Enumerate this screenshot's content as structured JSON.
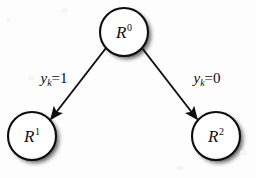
{
  "figure": {
    "type": "tree-diagram",
    "background_color": "#fdfdfd",
    "line_color": "#0d0d0d",
    "shadow_color": "#9a9a9a"
  },
  "nodes": [
    {
      "id": "root",
      "name": "node-r0",
      "label_base": "R",
      "label_sup": "0",
      "cx": 124,
      "cy": 32,
      "r": 24
    },
    {
      "id": "left",
      "name": "node-r1",
      "label_base": "R",
      "label_sup": "1",
      "cx": 32,
      "cy": 136,
      "r": 24
    },
    {
      "id": "right",
      "name": "node-r2",
      "label_base": "R",
      "label_sup": "2",
      "cx": 216,
      "cy": 136,
      "r": 24
    }
  ],
  "edges": [
    {
      "id": "edge-left",
      "name": "edge-root-to-r1",
      "from": "root",
      "to": "left",
      "label_var": "y",
      "label_sub": "k",
      "label_eq": "=1",
      "label_x": 54,
      "label_y": 78,
      "x1": 106,
      "y1": 48,
      "x2": 51,
      "y2": 119
    },
    {
      "id": "edge-right",
      "name": "edge-root-to-r2",
      "from": "root",
      "to": "right",
      "label_var": "y",
      "label_sub": "k",
      "label_eq": "=0",
      "label_x": 207,
      "label_y": 78,
      "x1": 142,
      "y1": 48,
      "x2": 197,
      "y2": 119
    }
  ]
}
